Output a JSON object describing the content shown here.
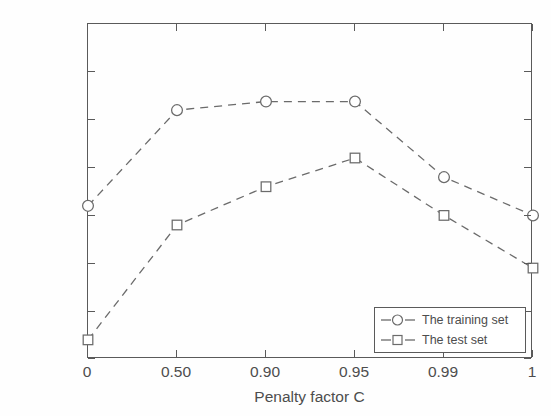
{
  "chart_data": {
    "type": "line",
    "title": "",
    "xlabel": "Penalty factor C",
    "ylabel": "Overall accuracy",
    "categories": [
      "0",
      "0.50",
      "0.90",
      "0.95",
      "0.99",
      "1"
    ],
    "xtick_labels": [
      "0",
      "0.50",
      "0.90",
      "0.95",
      "0.99",
      "1"
    ],
    "ytick_labels": [
      "0.94",
      "0.945",
      "0.95",
      "0.955",
      "0.96",
      "0.965",
      "0.97",
      "0.975"
    ],
    "ytick_values": [
      0.94,
      0.945,
      0.95,
      0.955,
      0.96,
      0.965,
      0.97,
      0.975
    ],
    "ylim": [
      0.94,
      0.975
    ],
    "grid": false,
    "legend_position": "lower right",
    "line_style": "dashed",
    "line_color": "#6b6b6b",
    "series": [
      {
        "name": "The training set",
        "marker": "circle",
        "values": [
          0.956,
          0.966,
          0.9669,
          0.9669,
          0.959,
          0.955
        ]
      },
      {
        "name": "The test set",
        "marker": "square",
        "values": [
          0.942,
          0.954,
          0.958,
          0.961,
          0.955,
          0.9495
        ]
      }
    ]
  },
  "legend": {
    "entries": [
      {
        "label": "The training set",
        "marker": "circle-marker"
      },
      {
        "label": "The test set",
        "marker": "square-marker"
      }
    ]
  }
}
